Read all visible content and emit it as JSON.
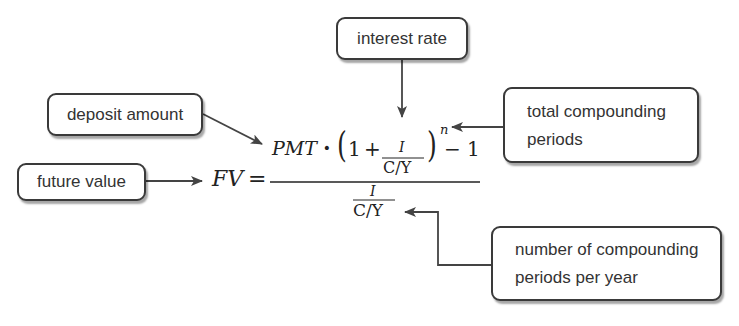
{
  "labels": {
    "interest_rate": "interest rate",
    "deposit_amount": "deposit amount",
    "future_value": "future value",
    "total_compounding_periods": [
      "total compounding",
      "periods"
    ],
    "periods_per_year": [
      "number of compounding",
      "periods per year"
    ]
  },
  "formula": {
    "lhs": "FV",
    "equals": "=",
    "numerator": {
      "pmt": "PMT",
      "dot": "·",
      "open_paren": "(",
      "one": "1",
      "plus": "+",
      "inner_num": "I",
      "inner_den": "C/Y",
      "close_paren": ")",
      "exponent": "n",
      "minus_one": "− 1"
    },
    "denominator": {
      "num": "I",
      "den": "C/Y"
    }
  },
  "colors": {
    "stroke": "#3a3a3a",
    "text": "#333333"
  }
}
